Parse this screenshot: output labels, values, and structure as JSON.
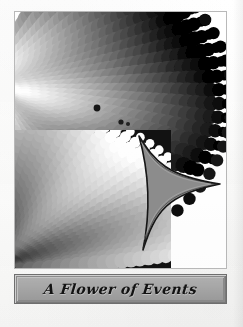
{
  "page": {
    "kind": "printed-plate",
    "background_color": "#fdfdfc",
    "frame_color": "#b9b9b9"
  },
  "caption": {
    "text": "A Flower of Events",
    "banner_fill": "#a9a9a9",
    "banner_border": "#6f6f6f",
    "text_color": "#121212"
  },
  "artwork": {
    "title": "A Flower of Events",
    "palette": {
      "white": "#ffffff",
      "light": "#e6e6e6",
      "mid_light": "#c2c2c2",
      "mid": "#9a9a9a",
      "mid_dark": "#6a6a6a",
      "dark": "#3a3a3a",
      "black": "#0d0d0d",
      "panel_background": "#121212",
      "star_fill": "#8d8d8d",
      "star_outline": "#1a1a1a"
    },
    "elements": [
      {
        "name": "upper-radial-bloom",
        "description": "overlapping circle fan radiating from left toward upper right, light core to dark rim"
      },
      {
        "name": "inset-dark-panel",
        "description": "dark rectangular panel containing a light circle fan radiating from lower left"
      },
      {
        "name": "three-point-star",
        "description": "concave three pointed star pointing right, gray fill with dark outline"
      }
    ]
  }
}
